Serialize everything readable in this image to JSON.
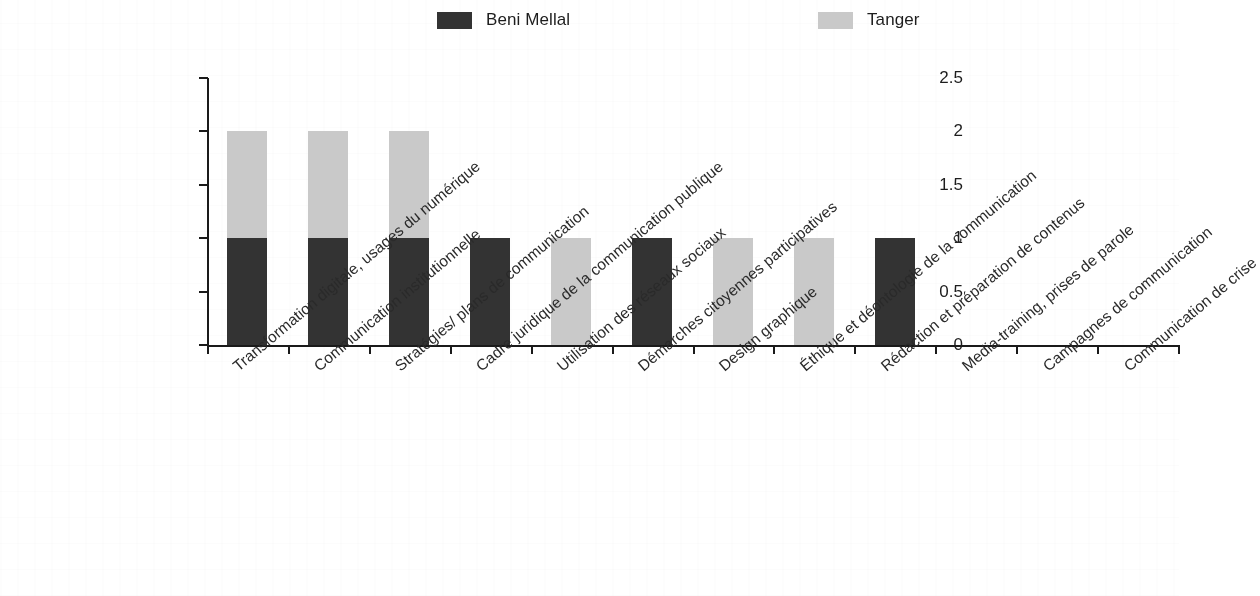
{
  "chart_data": {
    "type": "bar",
    "stacked": true,
    "title": "",
    "subtitle": "",
    "xlabel": "",
    "ylabel": "",
    "ylim": [
      0,
      2.5
    ],
    "ytick_values": [
      0,
      0.5,
      1,
      1.5,
      2,
      2.5
    ],
    "ytick_labels": [
      "0",
      "0.5",
      "1",
      "1.5",
      "2",
      "2.5"
    ],
    "grid": false,
    "legend_position": "top",
    "categories": [
      "Transformation digitale, usages du numérique",
      "Communication institutionnelle",
      "Stratégies/ plans de communication",
      "Cadre juridique de la communication publique",
      "Utilisation des réseaux sociaux",
      "Démarches citoyennes participatives",
      "Design graphique",
      "Éthique et déontologie de la communication",
      "Rédaction et préparation de contenus",
      "Media-training, prises de parole",
      "Campagnes de communication",
      "Communication de crise"
    ],
    "series": [
      {
        "name": "Beni Mellal",
        "color": "#333333",
        "values": [
          1,
          1,
          1,
          1,
          0,
          1,
          0,
          0,
          1,
          0,
          0,
          0
        ]
      },
      {
        "name": "Tanger",
        "color": "#c9c9c9",
        "values": [
          1,
          1,
          1,
          0,
          1,
          0,
          1,
          1,
          0,
          0,
          0,
          0
        ]
      }
    ]
  },
  "legend": {
    "entries": [
      {
        "label": "Beni Mellal",
        "color": "#333333"
      },
      {
        "label": "Tanger",
        "color": "#c9c9c9"
      }
    ]
  },
  "axis": {
    "y_labels": [
      "2.5",
      "2",
      "1.5",
      "1",
      "0.5",
      "0"
    ]
  }
}
